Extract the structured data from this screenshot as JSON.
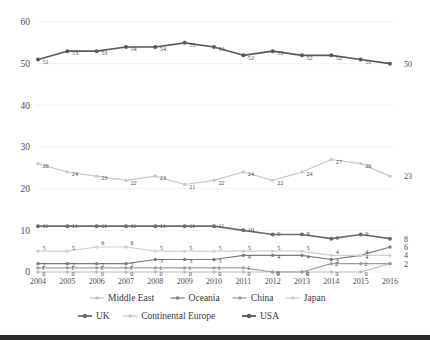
{
  "chart_data": {
    "type": "line",
    "title": "",
    "xlabel": "",
    "ylabel": "",
    "categories": [
      "2004",
      "2005",
      "2006",
      "2007",
      "2008",
      "2009",
      "2010",
      "2011",
      "2012",
      "2013",
      "2014",
      "2015",
      "2016"
    ],
    "ylim": [
      0,
      60
    ],
    "yticks": [
      "0",
      "10",
      "20",
      "30",
      "40",
      "50",
      "60"
    ],
    "grid": true,
    "legend_position": "bottom",
    "series": [
      {
        "name": "Middle East",
        "color": "#bfbfbf",
        "values": [
          0,
          0,
          0,
          0,
          0,
          0,
          0,
          0,
          0,
          0,
          0,
          0,
          2
        ],
        "labels": [
          "0",
          "0",
          "0",
          "0",
          "0",
          "0",
          "0",
          "0",
          "0",
          "0",
          "0",
          "0",
          "2"
        ]
      },
      {
        "name": "Oceania",
        "color": "#7a7a7a",
        "values": [
          2,
          2,
          2,
          2,
          3,
          3,
          3,
          4,
          4,
          4,
          3,
          4,
          6
        ],
        "labels": [
          "2",
          "2",
          "2",
          "2",
          "3",
          "3",
          "3",
          "4",
          "4",
          "4",
          "3",
          "4",
          "6"
        ]
      },
      {
        "name": "China",
        "color": "#9e9e9e",
        "values": [
          1,
          1,
          1,
          1,
          1,
          1,
          1,
          1,
          0,
          0,
          2,
          2,
          2
        ],
        "labels": [
          "1",
          "1",
          "1",
          "1",
          "1",
          "1",
          "1",
          "1",
          "0",
          "0",
          "2",
          "2",
          "2"
        ]
      },
      {
        "name": "Japan",
        "color": "#cfcfcf",
        "values": [
          5,
          5,
          6,
          6,
          5,
          5,
          5,
          5,
          5,
          5,
          4,
          4,
          4
        ],
        "labels": [
          "5",
          "5",
          "6",
          "6",
          "5",
          "5",
          "5",
          "5",
          "5",
          "5",
          "4",
          "4",
          "4"
        ]
      },
      {
        "name": "UK",
        "color": "#6b6b6b",
        "values": [
          11,
          11,
          11,
          11,
          11,
          11,
          11,
          10,
          9,
          9,
          8,
          9,
          8
        ],
        "labels": [
          "11",
          "11",
          "11",
          "11",
          "11",
          "11",
          "11",
          "10",
          "9",
          "9",
          "8",
          "9",
          "8"
        ]
      },
      {
        "name": "Continental Europe",
        "color": "#c8c8c8",
        "values": [
          26,
          24,
          23,
          22,
          23,
          21,
          22,
          24,
          22,
          24,
          27,
          26,
          23
        ],
        "labels": [
          "26",
          "24",
          "23",
          "22",
          "23",
          "21",
          "22",
          "24",
          "22",
          "24",
          "27",
          "26",
          "23"
        ]
      },
      {
        "name": "USA",
        "color": "#595959",
        "values": [
          51,
          53,
          53,
          54,
          54,
          55,
          54,
          52,
          53,
          52,
          52,
          51,
          50
        ],
        "labels": [
          "51",
          "53",
          "53",
          "54",
          "54",
          "55",
          "54",
          "52",
          "53",
          "52",
          "52",
          "51",
          "50"
        ]
      }
    ],
    "end_labels": [
      {
        "series": "USA",
        "text": "50",
        "value": 50
      },
      {
        "series": "Continental Europe",
        "text": "23",
        "value": 23
      },
      {
        "series": "UK",
        "text": "8",
        "value": 8
      },
      {
        "series": "Oceania",
        "text": "6",
        "value": 6
      },
      {
        "series": "Japan",
        "text": "4",
        "value": 4
      },
      {
        "series": "Middle East",
        "text": "2",
        "value": 2
      }
    ]
  },
  "legend": {
    "row1": [
      "Middle East",
      "Oceania",
      "China",
      "Japan"
    ],
    "row2": [
      "UK",
      "Continental Europe",
      "USA"
    ]
  }
}
